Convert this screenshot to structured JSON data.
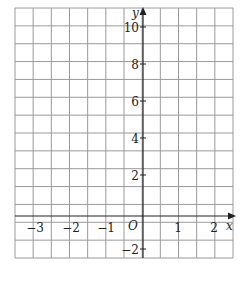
{
  "chart_data": {
    "type": "line",
    "title": "",
    "xlabel": "x",
    "ylabel": "y",
    "origin_label": "O",
    "xlim": [
      -3.5,
      2.5
    ],
    "ylim": [
      -3,
      11
    ],
    "grid": true,
    "grid_step_x": 0.5,
    "grid_step_y": 1,
    "x_ticks": [
      "-3",
      "-2",
      "-1",
      "1",
      "2"
    ],
    "y_ticks": [
      "10",
      "8",
      "6",
      "4",
      "2",
      "-2"
    ],
    "series": []
  },
  "labels": {
    "x_axis": "x",
    "y_axis": "y",
    "origin": "O",
    "x_ticks": [
      {
        "value": -3,
        "text": "−3"
      },
      {
        "value": -2,
        "text": "−2"
      },
      {
        "value": -1,
        "text": "−1"
      },
      {
        "value": 1,
        "text": "1"
      },
      {
        "value": 2,
        "text": "2"
      }
    ],
    "y_ticks": [
      {
        "value": 10,
        "text": "10"
      },
      {
        "value": 8,
        "text": "8"
      },
      {
        "value": 6,
        "text": "6"
      },
      {
        "value": 4,
        "text": "4"
      },
      {
        "value": 2,
        "text": "2"
      },
      {
        "value": -2,
        "text": "−2"
      }
    ]
  },
  "colors": {
    "grid": "#9a9a9a",
    "axis": "#222222",
    "text": "#222222"
  }
}
